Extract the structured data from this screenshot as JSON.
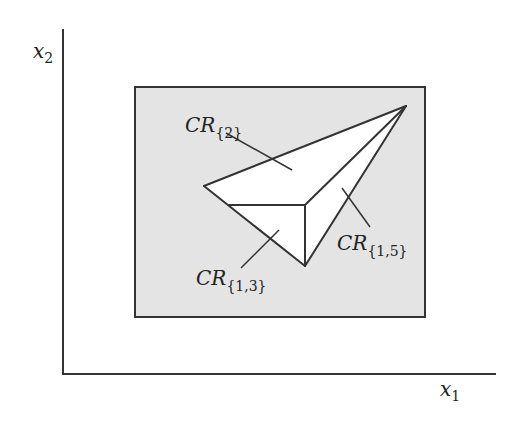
{
  "figure": {
    "type": "critical-region-partition",
    "background_color": "#ffffff",
    "region_fill_color": "#e4e4e4",
    "polygon_fill_color": "#ffffff",
    "stroke_color": "#333333"
  },
  "axes": {
    "origin": [
      63,
      374
    ],
    "x_axis_end": [
      496,
      374
    ],
    "y_axis_end": [
      63,
      29
    ],
    "x_label": {
      "main": "x",
      "sub": "1"
    },
    "y_label": {
      "main": "x",
      "sub": "2"
    }
  },
  "parameter_space": {
    "label": "bounding box",
    "x": 135,
    "y": 87,
    "width": 290,
    "height": 230
  },
  "vertices": {
    "apex": [
      406,
      106
    ],
    "left": [
      204,
      186
    ],
    "junction": [
      305,
      205
    ],
    "bottom": [
      305,
      266
    ],
    "left_edge_point": [
      229,
      205
    ]
  },
  "regions": [
    {
      "id": "cr2",
      "label": {
        "main": "CR",
        "sub": "{2}"
      },
      "label_pos": [
        185,
        132
      ],
      "pointer": [
        [
          226,
          133
        ],
        [
          292,
          170
        ]
      ]
    },
    {
      "id": "cr15",
      "label": {
        "main": "CR",
        "sub": "{1,5}"
      },
      "label_pos": [
        337,
        250
      ],
      "pointer": [
        [
          342,
          188
        ],
        [
          370,
          227
        ]
      ]
    },
    {
      "id": "cr13",
      "label": {
        "main": "CR",
        "sub": "{1,3}"
      },
      "label_pos": [
        196,
        285
      ],
      "pointer": [
        [
          279,
          230
        ],
        [
          241,
          268
        ]
      ]
    }
  ]
}
